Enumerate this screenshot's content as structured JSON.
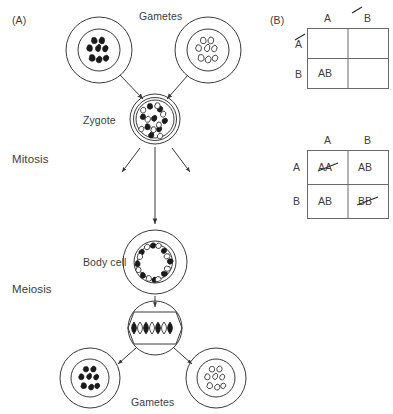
{
  "figure": {
    "panel_a": {
      "label": "(A)",
      "top_gametes_label": "Gametes",
      "zygote_label": "Zygote",
      "mitosis_label": "Mitosis",
      "body_cell_label": "Body cell",
      "meiosis_label": "Meiosis",
      "bottom_gametes_label": "Gametes",
      "cells": [
        {
          "name": "maternal-gamete",
          "chromosome_style": "filled",
          "chromosome_count": 8
        },
        {
          "name": "paternal-gamete",
          "chromosome_style": "hollow",
          "chromosome_count": 8
        },
        {
          "name": "zygote",
          "chromosome_style": "mixed",
          "chromosome_count": 16
        },
        {
          "name": "body-cell",
          "chromosome_style": "mixed-ring",
          "chromosome_count": 16
        },
        {
          "name": "meiotic-cell",
          "chromosome_style": "paired-spindle",
          "chromosome_count": 8
        },
        {
          "name": "daughter-gamete-left",
          "chromosome_style": "filled",
          "chromosome_count": 8
        },
        {
          "name": "daughter-gamete-right",
          "chromosome_style": "hollow",
          "chromosome_count": 8
        }
      ]
    },
    "panel_b": {
      "label": "(B)",
      "squares": [
        {
          "name": "punnett-square-top",
          "col_headers": [
            "A",
            "B"
          ],
          "col_header_strike": [
            false,
            true
          ],
          "row_headers": [
            "A",
            "B"
          ],
          "row_header_strike": [
            true,
            false
          ],
          "cells": [
            [
              {
                "text": "",
                "strike": false
              },
              {
                "text": "",
                "strike": false
              }
            ],
            [
              {
                "text": "AB",
                "strike": false
              },
              {
                "text": "",
                "strike": false
              }
            ]
          ]
        },
        {
          "name": "punnett-square-bottom",
          "col_headers": [
            "A",
            "B"
          ],
          "col_header_strike": [
            false,
            false
          ],
          "row_headers": [
            "A",
            "B"
          ],
          "row_header_strike": [
            false,
            false
          ],
          "cells": [
            [
              {
                "text": "AA",
                "strike": true
              },
              {
                "text": "AB",
                "strike": false
              }
            ],
            [
              {
                "text": "AB",
                "strike": false
              },
              {
                "text": "BB",
                "strike": true
              }
            ]
          ]
        }
      ]
    },
    "colors": {
      "stroke": "#3a3a3a",
      "chromosome_fill_dark": "#1a1a1a",
      "chromosome_fill_light": "#ffffff",
      "background": "#ffffff",
      "grid_stroke": "#6a6a6a"
    }
  }
}
